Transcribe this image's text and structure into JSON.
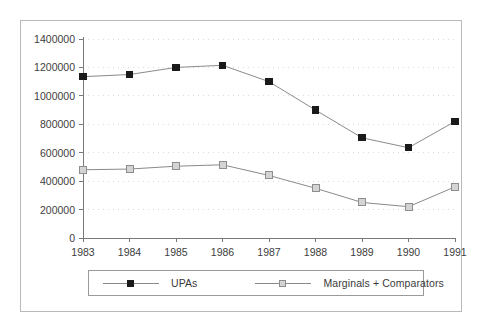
{
  "chart_data": {
    "type": "line",
    "title": "",
    "subtitle": "",
    "xlabel": "",
    "ylabel": "",
    "grid": true,
    "grid_style": "dotted-horizontal",
    "legend_position": "bottom",
    "categories": [
      "1983",
      "1984",
      "1985",
      "1986",
      "1987",
      "1988",
      "1989",
      "1990",
      "1991"
    ],
    "x": [
      1983,
      1984,
      1985,
      1986,
      1987,
      1988,
      1989,
      1990,
      1991
    ],
    "xlim": [
      1983,
      1991
    ],
    "ylim": [
      0,
      1400000
    ],
    "ytick_labels": [
      "0",
      "200000",
      "400000",
      "600000",
      "800000",
      "1000000",
      "1200000",
      "1400000"
    ],
    "yticks": [
      0,
      200000,
      400000,
      600000,
      800000,
      1000000,
      1200000,
      1400000
    ],
    "xtick_labels": [
      "1983",
      "1984",
      "1985",
      "1986",
      "1987",
      "1988",
      "1989",
      "1990",
      "1991"
    ],
    "series": [
      {
        "name": "UPAs",
        "marker": "filled-square",
        "color": "#1a1a1a",
        "line_color": "#8a8a8a",
        "values": [
          1135000,
          1150000,
          1200000,
          1215000,
          1100000,
          900000,
          705000,
          635000,
          820000
        ]
      },
      {
        "name": "Marginals + Comparators",
        "marker": "open-square",
        "color": "#d4d4d4",
        "line_color": "#8a8a8a",
        "values": [
          480000,
          485000,
          505000,
          515000,
          440000,
          350000,
          250000,
          220000,
          360000
        ]
      }
    ]
  },
  "legend": {
    "entries": [
      {
        "label": "UPAs"
      },
      {
        "label": "Marginals + Comparators"
      }
    ]
  },
  "colors": {
    "frame": "#b9b9b9",
    "axis": "#7a7a7a",
    "gridline": "#d9d9d9",
    "series_upas": "#1a1a1a",
    "series_marginals": "#d4d4d4",
    "text": "#3d3d3d"
  }
}
